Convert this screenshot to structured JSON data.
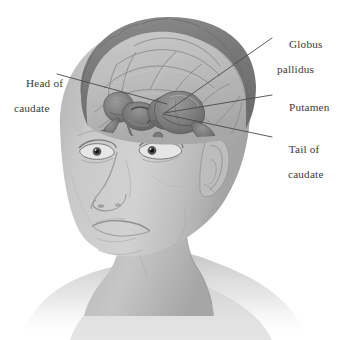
{
  "figure": {
    "background_color": "#ffffff",
    "width": 341,
    "height": 340
  },
  "labels": {
    "globus_pallidus": {
      "line1": "Globus",
      "line2": "pallidus"
    },
    "putamen": {
      "line1": "Putamen",
      "line2": ""
    },
    "tail_of_caudate": {
      "line1": "Tail of",
      "line2": "caudate"
    },
    "head_of_caudate": {
      "line1": "Head of",
      "line2": "caudate"
    }
  },
  "colors": {
    "label_text": "#3a3a3a",
    "leader_line": "#4a4a4a",
    "skin_light": "#cfcfcf",
    "skin_mid": "#b4b4b4",
    "skin_shadow": "#8f8f8f",
    "brain_rim_dark": "#7a7a7a",
    "brain_cortex": "#b9b9b9",
    "brain_sulci": "#8a8a8a",
    "nucleus_dark": "#6e6e6e",
    "nucleus_mid": "#858585",
    "eye_pupil": "#1a1a1a",
    "hair_dark": "#6b6b6b"
  },
  "leader_lines": [
    {
      "name": "globus-pallidus-leader",
      "x1": 272,
      "y1": 38,
      "x2": 166,
      "y2": 112
    },
    {
      "name": "putamen-leader",
      "x1": 272,
      "y1": 95,
      "x2": 164,
      "y2": 113
    },
    {
      "name": "tail-of-caudate-leader",
      "x1": 272,
      "y1": 137,
      "x2": 163,
      "y2": 114
    },
    {
      "name": "head-of-caudate-leader",
      "x1": 57,
      "y1": 74,
      "x2": 167,
      "y2": 104
    }
  ],
  "structures": [
    {
      "name": "head-of-caudate",
      "description": "anterior enlarged nucleus mass"
    },
    {
      "name": "putamen",
      "description": "lateral lens-shaped nucleus"
    },
    {
      "name": "globus-pallidus",
      "description": "medial pale nucleus"
    },
    {
      "name": "tail-of-caudate",
      "description": "slender posterior-curving tail"
    }
  ]
}
